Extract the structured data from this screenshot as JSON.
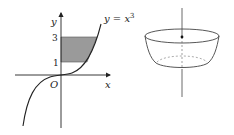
{
  "figure_left": {
    "y_axis_label": "y",
    "x_axis_label": "x",
    "origin_label": "O",
    "tick_3": "3",
    "tick_1": "1",
    "curve_label_prefix": "y = x",
    "curve_label_exponent": "3",
    "shade_color": "#9a9a9a",
    "line_color": "#222222"
  },
  "figure_right": {
    "description": "solid of revolution (bowl) about vertical axis",
    "line_color": "#444444"
  }
}
